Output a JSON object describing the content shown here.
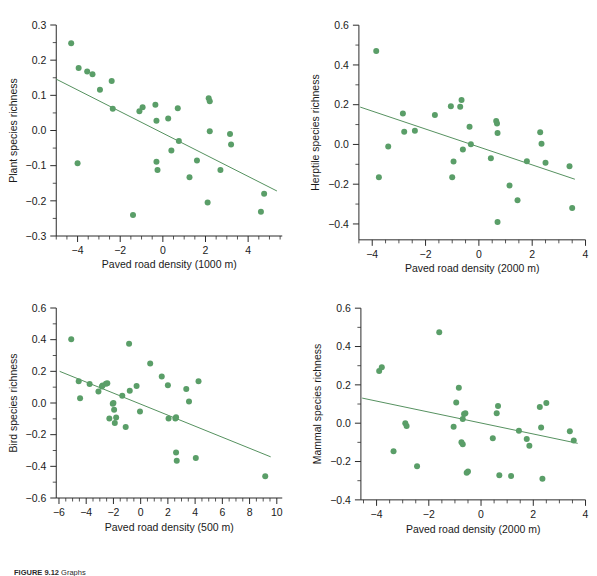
{
  "figure": {
    "caption_label": "FIGURE 9.12",
    "caption_text": "Graphs"
  },
  "colors": {
    "marker": "#5a9e68",
    "fit_line": "#55915f",
    "axis": "#2b2b2b",
    "background": "#ffffff"
  },
  "chart_data": [
    {
      "id": "plant",
      "type": "scatter",
      "title": "",
      "xlabel": "Paved road density (1000 m)",
      "ylabel": "Plant species richness",
      "xlim": [
        -5.0,
        5.6
      ],
      "ylim": [
        -0.3,
        0.3
      ],
      "xticks": [
        -4,
        -2,
        0,
        2,
        4
      ],
      "yticks": [
        -0.3,
        -0.2,
        -0.1,
        0.0,
        0.1,
        0.2,
        0.3
      ],
      "ytick_labels": [
        "-0.3",
        "-0.2",
        "-0.1",
        "0.0",
        "0.1",
        "0.2",
        "0.3"
      ],
      "xtick_labels": [
        "-4",
        "-2",
        "0",
        "2",
        "4"
      ],
      "x_minor_step": 0.5,
      "y_minor_step": 0.05,
      "grid": false,
      "legend": "none",
      "fit": {
        "x": [
          -5.0,
          5.35
        ],
        "y": [
          0.146,
          -0.172
        ]
      },
      "points": [
        [
          -4.3,
          0.248
        ],
        [
          -3.95,
          0.178
        ],
        [
          -3.55,
          0.168
        ],
        [
          -3.3,
          0.16
        ],
        [
          -2.95,
          0.116
        ],
        [
          -2.4,
          0.141
        ],
        [
          -2.35,
          0.062
        ],
        [
          -1.4,
          -0.24
        ],
        [
          -1.1,
          0.055
        ],
        [
          -0.95,
          0.066
        ],
        [
          -0.35,
          0.073
        ],
        [
          -0.3,
          0.028
        ],
        [
          -0.3,
          -0.089
        ],
        [
          -0.25,
          -0.112
        ],
        [
          0.25,
          0.034
        ],
        [
          0.4,
          -0.057
        ],
        [
          0.7,
          0.063
        ],
        [
          0.75,
          -0.03
        ],
        [
          1.25,
          -0.133
        ],
        [
          1.6,
          -0.085
        ],
        [
          2.1,
          -0.205
        ],
        [
          2.15,
          0.092
        ],
        [
          2.2,
          0.083
        ],
        [
          2.2,
          -0.002
        ],
        [
          2.7,
          -0.112
        ],
        [
          3.15,
          -0.01
        ],
        [
          3.2,
          -0.04
        ],
        [
          4.6,
          -0.231
        ],
        [
          4.75,
          -0.18
        ],
        [
          -4.0,
          -0.093
        ]
      ]
    },
    {
      "id": "herptile",
      "type": "scatter",
      "title": "",
      "xlabel": "Paved road density (2000 m)",
      "ylabel": "Herptile species richness",
      "xlim": [
        -4.5,
        4.0
      ],
      "ylim": [
        -0.48,
        0.6
      ],
      "xticks": [
        -4,
        -2,
        0,
        2,
        4
      ],
      "yticks": [
        -0.4,
        -0.2,
        0.0,
        0.2,
        0.4,
        0.6
      ],
      "ytick_labels": [
        "-0.4",
        "-0.2",
        "0.0",
        "0.2",
        "0.4",
        "0.6"
      ],
      "xtick_labels": [
        "-4",
        "-2",
        "0",
        "2",
        "4"
      ],
      "x_minor_step": 0.5,
      "y_minor_step": 0.1,
      "grid": false,
      "legend": "none",
      "fit": {
        "x": [
          -4.45,
          3.6
        ],
        "y": [
          0.188,
          -0.175
        ]
      },
      "points": [
        [
          -3.85,
          0.47
        ],
        [
          -3.75,
          -0.165
        ],
        [
          -3.4,
          -0.01
        ],
        [
          -2.85,
          0.156
        ],
        [
          -2.8,
          0.064
        ],
        [
          -2.4,
          0.069
        ],
        [
          -1.65,
          0.148
        ],
        [
          -1.05,
          0.192
        ],
        [
          -1.0,
          -0.165
        ],
        [
          -0.95,
          -0.086
        ],
        [
          -0.7,
          0.19
        ],
        [
          -0.65,
          0.224
        ],
        [
          -0.6,
          -0.026
        ],
        [
          -0.35,
          0.089
        ],
        [
          -0.3,
          0.001
        ],
        [
          0.45,
          -0.07
        ],
        [
          0.65,
          0.118
        ],
        [
          0.68,
          0.105
        ],
        [
          0.7,
          0.057
        ],
        [
          0.7,
          -0.39
        ],
        [
          1.15,
          -0.206
        ],
        [
          1.45,
          -0.281
        ],
        [
          1.8,
          -0.084
        ],
        [
          2.3,
          0.061
        ],
        [
          2.35,
          0.003
        ],
        [
          2.5,
          -0.092
        ],
        [
          3.4,
          -0.11
        ],
        [
          3.5,
          -0.32
        ]
      ]
    },
    {
      "id": "bird",
      "type": "scatter",
      "title": "",
      "xlabel": "Paved road density (500 m)",
      "ylabel": "Bird species richness",
      "xlim": [
        -6.2,
        10.4
      ],
      "ylim": [
        -0.6,
        0.6
      ],
      "xticks": [
        -6,
        -4,
        -2,
        0,
        2,
        4,
        6,
        8,
        10
      ],
      "yticks": [
        -0.6,
        -0.4,
        -0.2,
        0.0,
        0.2,
        0.4,
        0.6
      ],
      "ytick_labels": [
        "-0.6",
        "-0.4",
        "-0.2",
        "0.0",
        "0.2",
        "0.4",
        "0.6"
      ],
      "xtick_labels": [
        "-6",
        "-4",
        "-2",
        "0",
        "2",
        "4",
        "6",
        "8",
        "10"
      ],
      "x_minor_step": 0.5,
      "y_minor_step": 0.1,
      "grid": false,
      "legend": "none",
      "fit": {
        "x": [
          -5.95,
          9.55
        ],
        "y": [
          0.2,
          -0.34
        ]
      },
      "points": [
        [
          -5.1,
          0.403
        ],
        [
          -4.55,
          0.138
        ],
        [
          -4.45,
          0.03
        ],
        [
          -3.75,
          0.12
        ],
        [
          -3.1,
          0.073
        ],
        [
          -2.85,
          0.104
        ],
        [
          -2.8,
          0.11
        ],
        [
          -2.55,
          0.121
        ],
        [
          -2.45,
          0.124
        ],
        [
          -2.3,
          -0.098
        ],
        [
          -2.05,
          -0.005
        ],
        [
          -2.0,
          0.0
        ],
        [
          -1.95,
          -0.043
        ],
        [
          -1.9,
          -0.127
        ],
        [
          -1.8,
          -0.092
        ],
        [
          -1.35,
          0.046
        ],
        [
          -1.1,
          -0.152
        ],
        [
          -0.85,
          0.375
        ],
        [
          -0.8,
          0.077
        ],
        [
          -0.3,
          0.108
        ],
        [
          -0.05,
          -0.053
        ],
        [
          0.7,
          0.25
        ],
        [
          1.55,
          0.167
        ],
        [
          2.0,
          0.112
        ],
        [
          2.05,
          -0.098
        ],
        [
          2.55,
          -0.098
        ],
        [
          2.6,
          -0.09
        ],
        [
          2.6,
          -0.312
        ],
        [
          2.65,
          -0.365
        ],
        [
          3.35,
          0.088
        ],
        [
          3.55,
          0.01
        ],
        [
          4.05,
          -0.348
        ],
        [
          4.25,
          0.137
        ],
        [
          9.15,
          -0.462
        ]
      ]
    },
    {
      "id": "mammal",
      "type": "scatter",
      "title": "",
      "xlabel": "Paved road density (2000 m)",
      "ylabel": "Mammal species richness",
      "xlim": [
        -4.6,
        4.0
      ],
      "ylim": [
        -0.4,
        0.6
      ],
      "xticks": [
        -4,
        -2,
        0,
        2,
        4
      ],
      "yticks": [
        -0.4,
        -0.2,
        0.0,
        0.2,
        0.4,
        0.6
      ],
      "ytick_labels": [
        "-0.4",
        "-0.2",
        "0.0",
        "0.2",
        "0.4",
        "0.6"
      ],
      "xtick_labels": [
        "-4",
        "-2",
        "0",
        "2",
        "4"
      ],
      "x_minor_step": 0.5,
      "y_minor_step": 0.1,
      "grid": false,
      "legend": "none",
      "fit": {
        "x": [
          -4.55,
          3.7
        ],
        "y": [
          0.131,
          -0.105
        ]
      },
      "points": [
        [
          -3.9,
          0.272
        ],
        [
          -3.8,
          0.292
        ],
        [
          -3.35,
          -0.147
        ],
        [
          -2.9,
          0.0
        ],
        [
          -2.85,
          -0.015
        ],
        [
          -2.45,
          -0.225
        ],
        [
          -1.6,
          0.475
        ],
        [
          -1.05,
          -0.018
        ],
        [
          -0.95,
          0.108
        ],
        [
          -0.85,
          0.185
        ],
        [
          -0.75,
          -0.1
        ],
        [
          -0.7,
          -0.11
        ],
        [
          -0.7,
          0.022
        ],
        [
          -0.65,
          0.048
        ],
        [
          -0.6,
          0.052
        ],
        [
          -0.55,
          -0.258
        ],
        [
          -0.5,
          -0.252
        ],
        [
          0.45,
          -0.078
        ],
        [
          0.6,
          0.052
        ],
        [
          0.65,
          0.09
        ],
        [
          0.7,
          -0.272
        ],
        [
          1.15,
          -0.275
        ],
        [
          1.45,
          -0.04
        ],
        [
          1.75,
          -0.083
        ],
        [
          1.85,
          -0.118
        ],
        [
          2.25,
          0.085
        ],
        [
          2.3,
          -0.022
        ],
        [
          2.35,
          -0.29
        ],
        [
          2.5,
          0.105
        ],
        [
          3.4,
          -0.042
        ],
        [
          3.55,
          -0.09
        ]
      ]
    }
  ]
}
